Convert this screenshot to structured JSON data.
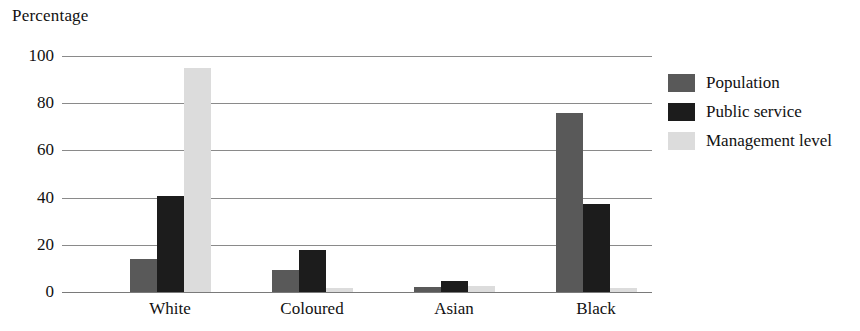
{
  "chart_data": {
    "type": "bar",
    "title": "",
    "subtitle": "",
    "xlabel": "",
    "ylabel": "Percentage",
    "ylim": [
      0,
      100
    ],
    "yticks": [
      0,
      20,
      40,
      60,
      80,
      100
    ],
    "ytick_labels": [
      "0",
      "20",
      "40",
      "60",
      "80",
      "100"
    ],
    "grid": true,
    "legend_position": "right",
    "categories": [
      "White",
      "Coloured",
      "Asian",
      "Black"
    ],
    "series": [
      {
        "name": "Population",
        "color": "#595959",
        "values": [
          14,
          9.5,
          2,
          76
        ]
      },
      {
        "name": "Public service",
        "color": "#1c1c1c",
        "values": [
          40.5,
          18,
          4.5,
          37.5
        ]
      },
      {
        "name": "Management level",
        "color": "#dcdcdc",
        "values": [
          95,
          1.5,
          2.5,
          1.5
        ]
      }
    ]
  }
}
